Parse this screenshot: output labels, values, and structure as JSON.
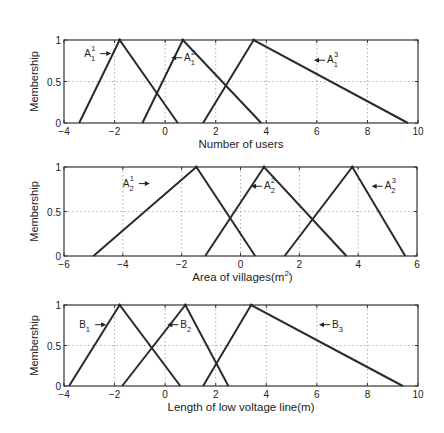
{
  "chart_data": [
    {
      "type": "line",
      "title": "",
      "xlabel": "Number of users",
      "ylabel": "Membership",
      "xlim": [
        -4,
        10
      ],
      "ylim": [
        0,
        1
      ],
      "xticks": [
        -4,
        -2,
        0,
        2,
        4,
        6,
        8,
        10
      ],
      "yticks": [
        0,
        0.5,
        1
      ],
      "ytick_labels": [
        "0",
        "0.5",
        "1"
      ],
      "grid": true,
      "series": [
        {
          "name": "A_1^1",
          "label_main": "A",
          "label_sub": "1",
          "label_sup": "1",
          "x": [
            -3.4,
            -1.8,
            0.5
          ],
          "y": [
            0,
            1,
            0
          ],
          "label_pos": [
            -3.2,
            0.8
          ],
          "arrow": "right"
        },
        {
          "name": "A_1^2",
          "label_main": "A",
          "label_sub": "1",
          "label_sup": "2",
          "x": [
            -0.9,
            0.7,
            3.8
          ],
          "y": [
            0,
            1,
            0
          ],
          "label_pos": [
            0.75,
            0.75
          ],
          "arrow": "left"
        },
        {
          "name": "A_1^3",
          "label_main": "A",
          "label_sub": "1",
          "label_sup": "3",
          "x": [
            1.5,
            3.5,
            9.6
          ],
          "y": [
            0,
            1,
            0
          ],
          "label_pos": [
            6.4,
            0.72
          ],
          "arrow": "left"
        }
      ]
    },
    {
      "type": "line",
      "title": "",
      "xlabel": "Area of villages(m",
      "xlabel_sup": "2",
      "xlabel_end": ")",
      "ylabel": "Membership",
      "xlim": [
        -6,
        6
      ],
      "ylim": [
        0,
        1
      ],
      "xticks": [
        -6,
        -4,
        -2,
        0,
        2,
        4,
        6
      ],
      "yticks": [
        0,
        0.5,
        1
      ],
      "ytick_labels": [
        "0",
        "0.5",
        "1"
      ],
      "grid": true,
      "series": [
        {
          "name": "A_2^1",
          "label_main": "A",
          "label_sub": "2",
          "label_sup": "1",
          "x": [
            -5.0,
            -1.5,
            0.5
          ],
          "y": [
            0,
            1,
            0
          ],
          "label_pos": [
            -4.0,
            0.78
          ],
          "arrow": "right"
        },
        {
          "name": "A_2^2",
          "label_main": "A",
          "label_sub": "2",
          "label_sup": "2",
          "x": [
            -1.2,
            0.8,
            3.6
          ],
          "y": [
            0,
            1,
            0
          ],
          "label_pos": [
            0.8,
            0.75
          ],
          "arrow": "left"
        },
        {
          "name": "A_2^3",
          "label_main": "A",
          "label_sub": "2",
          "label_sup": "3",
          "x": [
            1.5,
            3.8,
            5.6
          ],
          "y": [
            0,
            1,
            0
          ],
          "label_pos": [
            4.9,
            0.75
          ],
          "arrow": "left"
        }
      ]
    },
    {
      "type": "line",
      "title": "",
      "xlabel": "Length of low voltage line(m)",
      "ylabel": "Membership",
      "xlim": [
        -4,
        10
      ],
      "ylim": [
        0,
        1
      ],
      "xticks": [
        -4,
        -2,
        0,
        2,
        4,
        6,
        8,
        10
      ],
      "yticks": [
        0,
        0.5,
        1
      ],
      "ytick_labels": [
        "0",
        "0.5",
        "1"
      ],
      "grid": true,
      "series": [
        {
          "name": "B_1",
          "label_main": "B",
          "label_sub": "1",
          "label_sup": "",
          "x": [
            -3.8,
            -1.8,
            0.6
          ],
          "y": [
            0,
            1,
            0
          ],
          "label_pos": [
            -3.4,
            0.72
          ],
          "arrow": "right"
        },
        {
          "name": "B_2",
          "label_main": "B",
          "label_sub": "2",
          "label_sup": "",
          "x": [
            -1.7,
            0.8,
            2.5
          ],
          "y": [
            0,
            1,
            0
          ],
          "label_pos": [
            0.6,
            0.72
          ],
          "arrow": "left"
        },
        {
          "name": "B_3",
          "label_main": "B",
          "label_sub": "3",
          "label_sup": "",
          "x": [
            1.5,
            3.4,
            9.4
          ],
          "y": [
            0,
            1,
            0
          ],
          "label_pos": [
            6.6,
            0.72
          ],
          "arrow": "left"
        }
      ]
    }
  ],
  "layout": {
    "panels": [
      {
        "left": 64,
        "right": 418,
        "top": 40,
        "bottom": 123
      },
      {
        "left": 64,
        "right": 417,
        "top": 167,
        "bottom": 256
      },
      {
        "left": 64,
        "right": 418,
        "top": 305,
        "bottom": 386
      }
    ],
    "line_color": "#2a2a2a",
    "grid_color": "#9a9a9a",
    "axis_color": "#333333"
  }
}
